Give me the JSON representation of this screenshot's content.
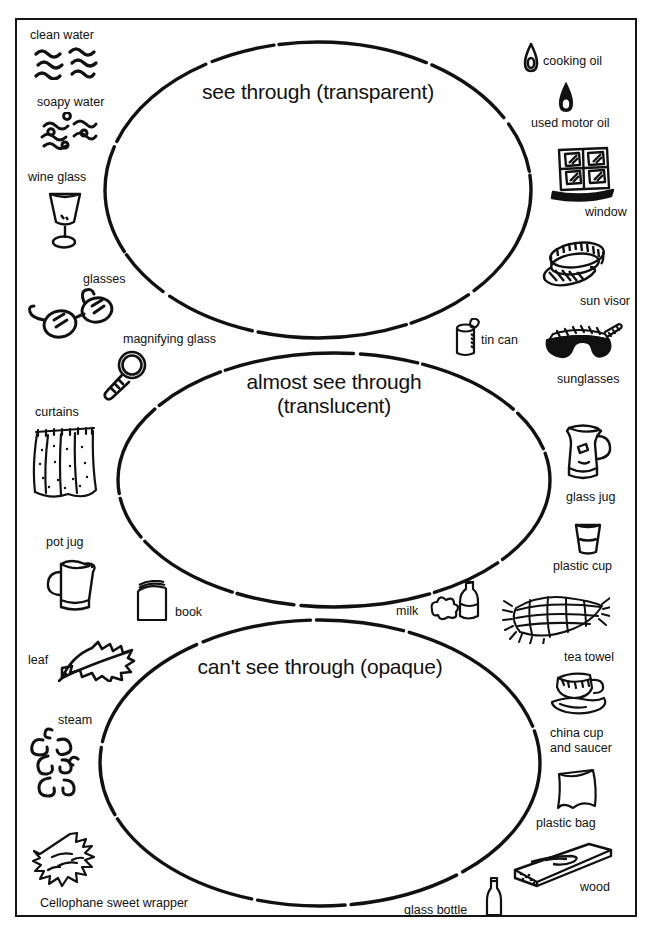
{
  "worksheet": {
    "zones": [
      {
        "id": "transparent",
        "title": "see through (transparent)",
        "cx": 318,
        "cy": 190,
        "rx": 213,
        "ry": 148
      },
      {
        "id": "translucent",
        "title": "almost see through\n(translucent)",
        "cx": 334,
        "cy": 480,
        "rx": 216,
        "ry": 127
      },
      {
        "id": "opaque",
        "title": "can't see through (opaque)",
        "cx": 320,
        "cy": 763,
        "rx": 220,
        "ry": 143
      }
    ],
    "items": [
      {
        "id": "clean-water",
        "label": "clean water",
        "icon": "wavy-lines-icon",
        "label_x": 30,
        "label_y": 28,
        "pic_x": 32,
        "pic_y": 46,
        "pic_w": 78,
        "pic_h": 34
      },
      {
        "id": "soapy-water",
        "label": "soapy water",
        "icon": "bubbly-wavy-lines-icon",
        "label_x": 37,
        "label_y": 95,
        "pic_x": 38,
        "pic_y": 112,
        "pic_w": 72,
        "pic_h": 38
      },
      {
        "id": "wine-glass",
        "label": "wine glass",
        "icon": "wine-glass-icon",
        "label_x": 28,
        "label_y": 170,
        "pic_x": 42,
        "pic_y": 188,
        "pic_w": 46,
        "pic_h": 62
      },
      {
        "id": "glasses",
        "label": "glasses",
        "icon": "eyeglasses-icon",
        "label_x": 83,
        "label_y": 272,
        "pic_x": 22,
        "pic_y": 286,
        "pic_w": 100,
        "pic_h": 56
      },
      {
        "id": "magnifying-glass",
        "label": "magnifying glass",
        "icon": "magnifying-glass-icon",
        "label_x": 123,
        "label_y": 332,
        "pic_x": 98,
        "pic_y": 348,
        "pic_w": 56,
        "pic_h": 54
      },
      {
        "id": "curtains",
        "label": "curtains",
        "icon": "curtains-icon",
        "label_x": 35,
        "label_y": 405,
        "pic_x": 30,
        "pic_y": 422,
        "pic_w": 70,
        "pic_h": 78
      },
      {
        "id": "pot-jug",
        "label": "pot jug",
        "icon": "pot-jug-icon",
        "label_x": 46,
        "label_y": 535,
        "pic_x": 41,
        "pic_y": 552,
        "pic_w": 60,
        "pic_h": 62
      },
      {
        "id": "book",
        "label": "book",
        "icon": "book-icon",
        "label_x": 175,
        "label_y": 605,
        "pic_x": 133,
        "pic_y": 580,
        "pic_w": 38,
        "pic_h": 42
      },
      {
        "id": "leaf",
        "label": "leaf",
        "icon": "leaf-icon",
        "label_x": 28,
        "label_y": 653,
        "pic_x": 58,
        "pic_y": 640,
        "pic_w": 78,
        "pic_h": 42
      },
      {
        "id": "steam",
        "label": "steam",
        "icon": "steam-icon",
        "label_x": 58,
        "label_y": 713,
        "pic_x": 28,
        "pic_y": 726,
        "pic_w": 66,
        "pic_h": 76
      },
      {
        "id": "cellophane-sweet-wrapper",
        "label": "Cellophane sweet wrapper",
        "icon": "sweet-wrapper-icon",
        "label_x": 40,
        "label_y": 896,
        "pic_x": 28,
        "pic_y": 830,
        "pic_w": 104,
        "pic_h": 58
      },
      {
        "id": "cooking-oil",
        "label": "cooking oil",
        "icon": "oil-drop-outline-icon",
        "label_x": 543,
        "label_y": 54,
        "pic_x": 521,
        "pic_y": 42,
        "pic_w": 20,
        "pic_h": 32
      },
      {
        "id": "used-motor-oil",
        "label": "used motor oil",
        "icon": "oil-drop-filled-icon",
        "label_x": 531,
        "label_y": 116,
        "pic_x": 556,
        "pic_y": 82,
        "pic_w": 20,
        "pic_h": 32
      },
      {
        "id": "window",
        "label": "window",
        "icon": "window-icon",
        "label_x": 585,
        "label_y": 205,
        "pic_x": 549,
        "pic_y": 146,
        "pic_w": 68,
        "pic_h": 56
      },
      {
        "id": "sun-visor",
        "label": "sun visor",
        "icon": "sun-visor-icon",
        "label_x": 580,
        "label_y": 294,
        "pic_x": 535,
        "pic_y": 240,
        "pic_w": 76,
        "pic_h": 50
      },
      {
        "id": "tin-can",
        "label": "tin can",
        "icon": "tin-can-icon",
        "label_x": 481,
        "label_y": 333,
        "pic_x": 452,
        "pic_y": 318,
        "pic_w": 28,
        "pic_h": 40
      },
      {
        "id": "sunglasses",
        "label": "sunglasses",
        "icon": "sunglasses-icon",
        "label_x": 557,
        "label_y": 372,
        "pic_x": 543,
        "pic_y": 320,
        "pic_w": 80,
        "pic_h": 44
      },
      {
        "id": "glass-jug",
        "label": "glass jug",
        "icon": "glass-jug-icon",
        "label_x": 566,
        "label_y": 490,
        "pic_x": 557,
        "pic_y": 422,
        "pic_w": 60,
        "pic_h": 64
      },
      {
        "id": "plastic-cup",
        "label": "plastic cup",
        "icon": "plastic-cup-icon",
        "label_x": 553,
        "label_y": 559,
        "pic_x": 572,
        "pic_y": 519,
        "pic_w": 32,
        "pic_h": 38
      },
      {
        "id": "milk",
        "label": "milk",
        "icon": "milk-bottle-spill-icon",
        "label_x": 396,
        "label_y": 604,
        "pic_x": 428,
        "pic_y": 580,
        "pic_w": 58,
        "pic_h": 42
      },
      {
        "id": "tea-towel",
        "label": "tea towel",
        "icon": "tea-towel-icon",
        "label_x": 564,
        "label_y": 650,
        "pic_x": 500,
        "pic_y": 592,
        "pic_w": 110,
        "pic_h": 52
      },
      {
        "id": "china-cup-and-saucer",
        "label": "china cup\nand saucer",
        "icon": "cup-and-saucer-icon",
        "label_x": 550,
        "label_y": 726,
        "pic_x": 548,
        "pic_y": 668,
        "pic_w": 64,
        "pic_h": 50
      },
      {
        "id": "plastic-bag",
        "label": "plastic bag",
        "icon": "plastic-bag-icon",
        "label_x": 536,
        "label_y": 816,
        "pic_x": 553,
        "pic_y": 766,
        "pic_w": 48,
        "pic_h": 46
      },
      {
        "id": "wood",
        "label": "wood",
        "icon": "wood-plank-icon",
        "label_x": 580,
        "label_y": 880,
        "pic_x": 511,
        "pic_y": 840,
        "pic_w": 104,
        "pic_h": 48
      },
      {
        "id": "glass-bottle",
        "label": "glass bottle",
        "icon": "glass-bottle-icon",
        "label_x": 404,
        "label_y": 903,
        "pic_x": 484,
        "pic_y": 876,
        "pic_w": 20,
        "pic_h": 42
      }
    ]
  }
}
